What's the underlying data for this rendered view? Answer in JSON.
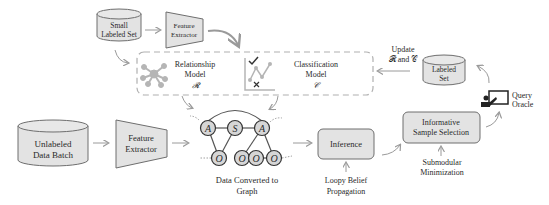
{
  "diagram": {
    "small_labeled_set": "Small Labeled Set",
    "small_labeled_set_lines": [
      "Small",
      "Labeled Set"
    ],
    "feature_extractor_top_lines": [
      "Feature",
      "Extractor"
    ],
    "relationship_model_lines": [
      "Relationship",
      "Model",
      "𝓡"
    ],
    "classification_model_lines": [
      "Classification",
      "Model",
      "𝒞"
    ],
    "update_label_lines": [
      "Update",
      "𝓡 and 𝒞"
    ],
    "labeled_set_lines": [
      "Labeled",
      "Set"
    ],
    "query_oracle_lines": [
      "Query",
      "Oracle"
    ],
    "unlabeled_batch_lines": [
      "Unlabeled",
      "Data Batch"
    ],
    "feature_extractor_bottom_lines": [
      "Feature",
      "Extractor"
    ],
    "graph_caption_lines": [
      "Data Converted to",
      "Graph"
    ],
    "graph_nodes": [
      "A",
      "S",
      "A",
      "O",
      "O",
      "O",
      "O"
    ],
    "inference_label": "Inference",
    "loopy_lines": [
      "Loopy Belief",
      "Propagation"
    ],
    "sample_selection_lines": [
      "Informative",
      "Sample Selection"
    ],
    "submodular_lines": [
      "Submodular",
      "Minimization"
    ],
    "colors": {
      "box_fill": "#e3e3e3",
      "box_stroke": "#6e6e6e",
      "arrow": "#9a9a9a",
      "dashed": "#b0b0b0",
      "icon": "#b5b5b5",
      "text": "#2a2a2a"
    }
  }
}
